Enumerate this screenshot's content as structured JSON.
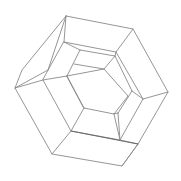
{
  "figure": {
    "stroke_color": "#8a8a8a",
    "background_color": "#ffffff",
    "outer_hexagon": [
      [
        66,
        16
      ],
      [
        133,
        29
      ],
      [
        168,
        92
      ],
      [
        138,
        144
      ],
      [
        122,
        166
      ],
      [
        52,
        154
      ],
      [
        15,
        88
      ],
      [
        22,
        70
      ]
    ],
    "edges": [
      [
        [
          66,
          16
        ],
        [
          133,
          29
        ]
      ],
      [
        [
          133,
          29
        ],
        [
          168,
          92
        ]
      ],
      [
        [
          168,
          92
        ],
        [
          138,
          144
        ]
      ],
      [
        [
          138,
          144
        ],
        [
          122,
          166
        ]
      ],
      [
        [
          122,
          166
        ],
        [
          52,
          154
        ]
      ],
      [
        [
          52,
          154
        ],
        [
          15,
          88
        ]
      ],
      [
        [
          15,
          88
        ],
        [
          48,
          70
        ]
      ],
      [
        [
          48,
          70
        ],
        [
          66,
          16
        ]
      ],
      [
        [
          66,
          16
        ],
        [
          22,
          70
        ]
      ],
      [
        [
          22,
          70
        ],
        [
          15,
          88
        ]
      ],
      [
        [
          66,
          16
        ],
        [
          64,
          42
        ]
      ],
      [
        [
          133,
          29
        ],
        [
          116,
          52
        ]
      ],
      [
        [
          168,
          92
        ],
        [
          143,
          99
        ]
      ],
      [
        [
          138,
          144
        ],
        [
          72,
          131
        ]
      ],
      [
        [
          52,
          154
        ],
        [
          71,
          131
        ]
      ],
      [
        [
          15,
          88
        ],
        [
          43,
          80
        ]
      ],
      [
        [
          64,
          42
        ],
        [
          116,
          52
        ]
      ],
      [
        [
          116,
          52
        ],
        [
          143,
          99
        ]
      ],
      [
        [
          143,
          99
        ],
        [
          120,
          140
        ]
      ],
      [
        [
          120,
          140
        ],
        [
          72,
          131
        ]
      ],
      [
        [
          72,
          131
        ],
        [
          43,
          80
        ]
      ],
      [
        [
          43,
          80
        ],
        [
          64,
          42
        ]
      ],
      [
        [
          64,
          42
        ],
        [
          80,
          50
        ]
      ],
      [
        [
          80,
          50
        ],
        [
          115,
          56
        ]
      ],
      [
        [
          115,
          56
        ],
        [
          116,
          52
        ]
      ],
      [
        [
          80,
          50
        ],
        [
          67,
          76
        ]
      ],
      [
        [
          67,
          76
        ],
        [
          43,
          80
        ]
      ],
      [
        [
          115,
          56
        ],
        [
          104,
          69
        ]
      ],
      [
        [
          104,
          69
        ],
        [
          74,
          64
        ]
      ],
      [
        [
          74,
          64
        ],
        [
          80,
          50
        ]
      ],
      [
        [
          104,
          69
        ],
        [
          128,
          96
        ]
      ],
      [
        [
          128,
          96
        ],
        [
          114,
          114
        ]
      ],
      [
        [
          114,
          114
        ],
        [
          84,
          108
        ]
      ],
      [
        [
          84,
          108
        ],
        [
          67,
          76
        ]
      ],
      [
        [
          128,
          96
        ],
        [
          143,
          99
        ]
      ],
      [
        [
          114,
          114
        ],
        [
          120,
          140
        ]
      ],
      [
        [
          84,
          108
        ],
        [
          72,
          131
        ]
      ],
      [
        [
          115,
          56
        ],
        [
          132,
          91
        ]
      ],
      [
        [
          132,
          91
        ],
        [
          118,
          113
        ]
      ],
      [
        [
          118,
          113
        ],
        [
          120,
          140
        ]
      ]
    ]
  }
}
